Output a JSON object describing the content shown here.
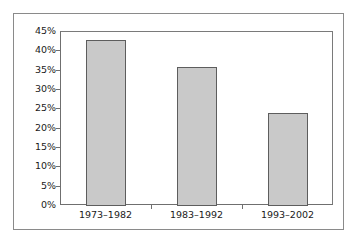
{
  "chart_data": {
    "type": "bar",
    "title": "",
    "subtitle": "",
    "xlabel": "",
    "ylabel": "",
    "categories": [
      "1973–1982",
      "1983–1992",
      "1993–2002"
    ],
    "values": [
      42.8,
      35.8,
      23.8
    ],
    "value_labels": [
      "42.8%",
      "35.8%",
      "23.8%"
    ],
    "ylim": [
      0,
      45
    ],
    "ytick_values": [
      0,
      5,
      10,
      15,
      20,
      25,
      30,
      35,
      40,
      45
    ],
    "ytick_labels": [
      "0%",
      "5%",
      "10%",
      "15%",
      "20%",
      "25%",
      "30%",
      "35%",
      "40%",
      "45%"
    ],
    "grid": false,
    "legend": null,
    "legend_position": "none",
    "series": [
      {
        "name": "",
        "values": [
          42.8,
          35.8,
          23.8
        ]
      }
    ],
    "colors": {
      "bar_fill": "#c9c9c9",
      "bar_edge": "#5d5d5d",
      "axis": "#6f6f6f",
      "frame": "#8a8a8a",
      "text": "#1a1a1a",
      "background": "#ffffff"
    }
  }
}
